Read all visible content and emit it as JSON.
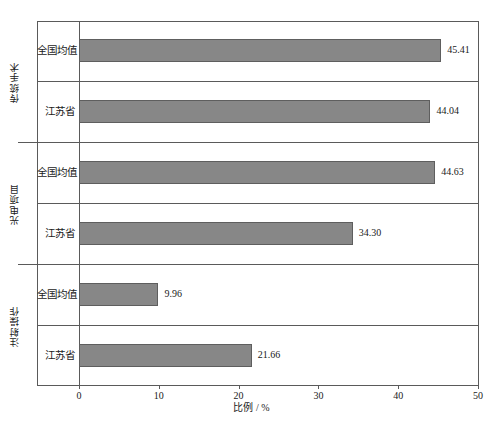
{
  "chart_data": {
    "type": "bar",
    "orientation": "horizontal",
    "title": "",
    "xlabel": "比例 / %",
    "ylabel": "",
    "xlim": [
      0,
      50
    ],
    "xticks": [
      0,
      10,
      20,
      30,
      40,
      50
    ],
    "grid": false,
    "legend": "none",
    "groups": [
      {
        "name": "传统手术",
        "categories": [
          "全国均值",
          "江苏省"
        ],
        "values": [
          45.41,
          44.04
        ],
        "labels": [
          "45.41",
          "44.04"
        ]
      },
      {
        "name": "光电项目",
        "categories": [
          "全国均值",
          "江苏省"
        ],
        "values": [
          44.63,
          34.3
        ],
        "labels": [
          "44.63",
          "34.30"
        ]
      },
      {
        "name": "注射操作",
        "categories": [
          "全国均值",
          "江苏省"
        ],
        "values": [
          9.96,
          21.66
        ],
        "labels": [
          "9.96",
          "21.66"
        ]
      }
    ],
    "bar_color": "#878787",
    "bar_border_color": "#5e5e5e",
    "axis_color": "#5a5a5a"
  },
  "axis": {
    "x_title": "比例 / %",
    "tick_labels": [
      "0",
      "10",
      "20",
      "30",
      "40",
      "50"
    ]
  },
  "bars": [
    {
      "label": "45.41",
      "cat": "全国均值",
      "group": "传统手术"
    },
    {
      "label": "44.04",
      "cat": "江苏省",
      "group": "传统手术"
    },
    {
      "label": "44.63",
      "cat": "全国均值",
      "group": "光电项目"
    },
    {
      "label": "34.30",
      "cat": "江苏省",
      "group": "光电项目"
    },
    {
      "label": "9.96",
      "cat": "全国均值",
      "group": "注射操作"
    },
    {
      "label": "21.66",
      "cat": "江苏省",
      "group": "注射操作"
    }
  ],
  "groups": [
    {
      "name": "传统手术"
    },
    {
      "name": "光电项目"
    },
    {
      "name": "注射操作"
    }
  ],
  "caption": ""
}
